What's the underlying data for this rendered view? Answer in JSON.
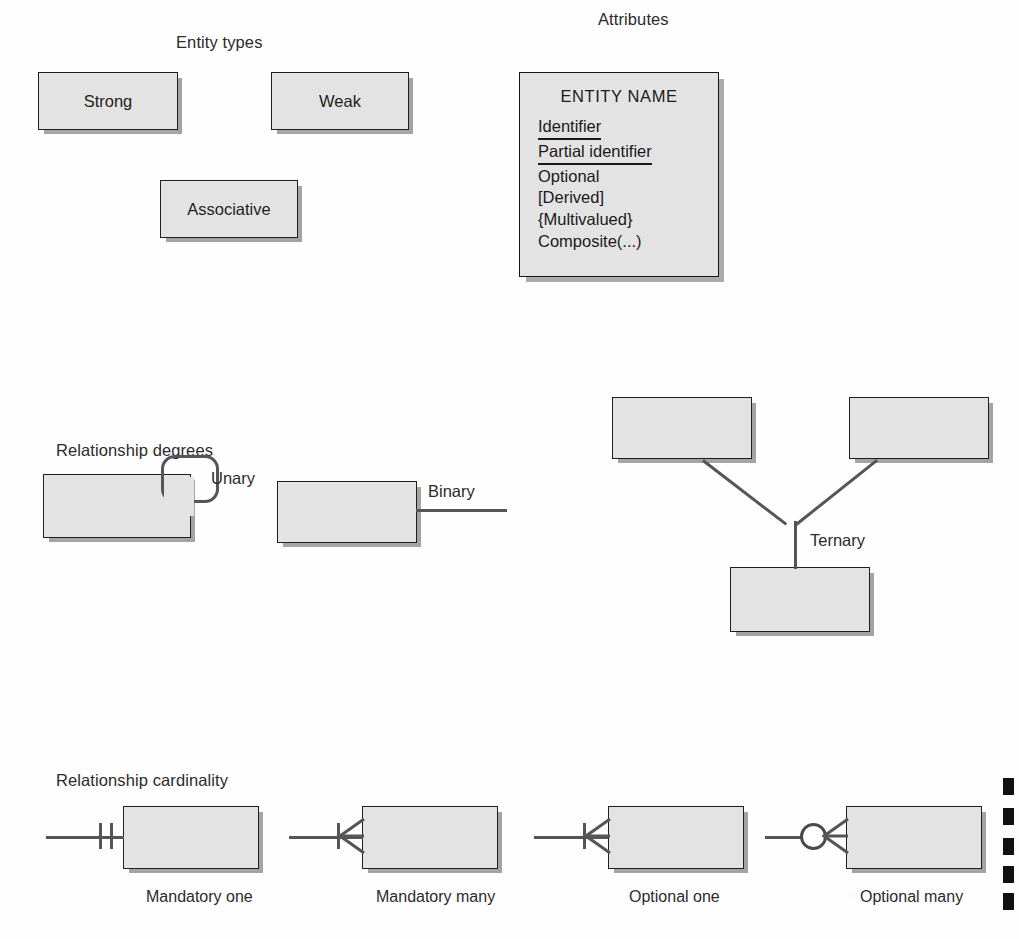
{
  "sections": {
    "entity_types": {
      "title": "Entity types"
    },
    "attributes": {
      "title": "Attributes"
    },
    "relationship_degrees": {
      "title": "Relationship degrees"
    },
    "relationship_cardinality": {
      "title": "Relationship cardinality"
    }
  },
  "entity_types": {
    "boxes": [
      {
        "label": "Strong"
      },
      {
        "label": "Weak"
      },
      {
        "label": "Associative"
      }
    ]
  },
  "attributes": {
    "entity_name": "ENTITY NAME",
    "items": [
      {
        "text": "Identifier",
        "style": "underline"
      },
      {
        "text": "Partial identifier",
        "style": "underline"
      },
      {
        "text": "Optional",
        "style": "plain"
      },
      {
        "text": "[Derived]",
        "style": "plain"
      },
      {
        "text": "{Multivalued}",
        "style": "plain"
      },
      {
        "text": "Composite(...)",
        "style": "plain"
      }
    ]
  },
  "relationship_degrees": {
    "unary_label": "Unary",
    "binary_label": "Binary",
    "ternary_label": "Ternary"
  },
  "relationship_cardinality": {
    "items": [
      {
        "label": "Mandatory one",
        "symbol": "two-ticks"
      },
      {
        "label": "Mandatory many",
        "symbol": "tick-crowsfoot"
      },
      {
        "label": "Optional one",
        "symbol": "tick-crowsfoot"
      },
      {
        "label": "Optional many",
        "symbol": "circle-crowsfoot"
      }
    ]
  },
  "colors": {
    "box_fill": "#e3e3e3",
    "box_border": "#1f1f1f",
    "line": "#555555",
    "text": "#1a1a1a",
    "background": "#ffffff"
  }
}
